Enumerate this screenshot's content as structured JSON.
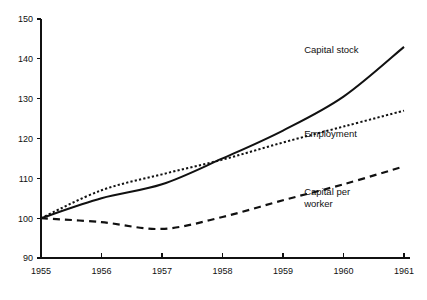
{
  "chart_data": {
    "type": "line",
    "title": "",
    "subtitle": "",
    "xlabel": "",
    "ylabel": "",
    "x": [
      1955,
      1956,
      1957,
      1958,
      1959,
      1960,
      1961
    ],
    "categories": [
      "1955",
      "1956",
      "1957",
      "1958",
      "1959",
      "1960",
      "1961"
    ],
    "xlim": [
      1955,
      1961
    ],
    "ylim": [
      90,
      150
    ],
    "yticks": [
      90,
      100,
      110,
      120,
      130,
      140,
      150
    ],
    "ytick_labels": [
      "90",
      "100",
      "110",
      "120",
      "130",
      "140",
      "150"
    ],
    "xticks": [
      1955,
      1956,
      1957,
      1958,
      1959,
      1960,
      1961
    ],
    "xtick_labels": [
      "1955",
      "1956",
      "1957",
      "1958",
      "1959",
      "1960",
      "1961"
    ],
    "grid": false,
    "legend_position": "inline-annotations",
    "series": [
      {
        "name": "Capital stock",
        "style": "solid",
        "color": "#111111",
        "values": [
          100,
          105,
          108.5,
          115,
          122,
          130.5,
          143
        ],
        "label": "Capital stock"
      },
      {
        "name": "Employment",
        "style": "dotted",
        "color": "#111111",
        "values": [
          100,
          107,
          111,
          114.7,
          119,
          123,
          127
        ],
        "label": "Employment"
      },
      {
        "name": "Capital per worker",
        "style": "dashed",
        "color": "#111111",
        "values": [
          100,
          99,
          97.3,
          100.3,
          104.5,
          108.5,
          113
        ],
        "label": "Capital per worker"
      }
    ],
    "annotations": [
      {
        "text": "Capital stock",
        "series": "Capital stock",
        "x": 1959.35,
        "y": 141.5
      },
      {
        "text": "Employment",
        "series": "Employment",
        "x": 1959.35,
        "y": 120.5
      },
      {
        "text": "Capital per worker",
        "series": "Capital per worker",
        "x": 1959.35,
        "y": 105.8,
        "line2": "worker"
      }
    ]
  },
  "labels": {
    "capital_stock": "Capital stock",
    "employment": "Employment",
    "capital_per_worker_line1": "Capital per",
    "capital_per_worker_line2": "worker"
  },
  "colors": {
    "ink": "#111111",
    "background": "#ffffff"
  }
}
